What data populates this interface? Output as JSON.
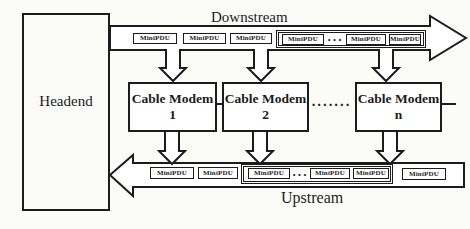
{
  "colors": {
    "ink": "#1c1c1c",
    "paper": "#fbfbf8"
  },
  "headend": {
    "label": "Headend"
  },
  "downstream": {
    "label": "Downstream",
    "pdus": [
      "MiniPDU",
      "MiniPDU",
      "MiniPDU"
    ],
    "group": {
      "pdus": [
        "MiniPDU",
        "MiniPDU",
        "MiniPDU"
      ],
      "dots": "···"
    }
  },
  "modems": [
    {
      "name": "Cable Modem",
      "id": "1"
    },
    {
      "name": "Cable Modem",
      "id": "2"
    },
    {
      "name": "Cable Modem",
      "id": "n"
    }
  ],
  "modem_ellipsis": "·······",
  "upstream": {
    "label": "Upstream",
    "pdus": [
      "MiniPDU",
      "MiniPDU"
    ],
    "group": {
      "pdus": [
        "MiniPDU",
        "MiniPDU",
        "MiniPDU"
      ],
      "dots": "···"
    },
    "pdu_right": "MiniPDU"
  }
}
